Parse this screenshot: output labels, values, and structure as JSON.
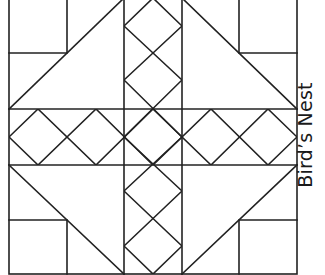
{
  "title": "Bird’s Nest",
  "colors": {
    "stroke": "#222222",
    "background": "#ffffff"
  },
  "block": {
    "x_grid": [
      9,
      67,
      124,
      182,
      239,
      297
    ],
    "y_grid": [
      -2,
      53,
      109,
      165,
      220,
      274
    ],
    "stroke_width": 1.6
  }
}
